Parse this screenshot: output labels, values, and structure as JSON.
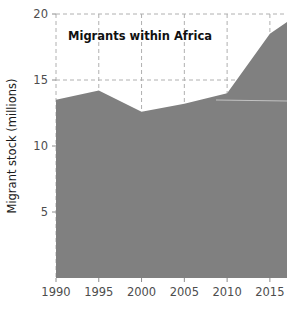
{
  "chart_data": {
    "type": "area",
    "title": "Migrants within Africa",
    "xlabel": "",
    "ylabel": "Migrant stock (millions)",
    "x": [
      1990,
      1995,
      2000,
      2005,
      2010,
      2015,
      2017
    ],
    "values": [
      13.5,
      14.2,
      12.6,
      13.2,
      14.0,
      18.5,
      19.4
    ],
    "series": [
      {
        "name": "Migrants within Africa",
        "values": [
          13.5,
          14.2,
          12.6,
          13.2,
          14.0,
          18.5,
          19.4
        ]
      }
    ],
    "xlim": [
      1990,
      2017
    ],
    "ylim": [
      0,
      20
    ],
    "xticks": [
      1990,
      1995,
      2000,
      2005,
      2010,
      2015
    ],
    "xtick_labels": [
      "1990",
      "1995",
      "2000",
      "2005",
      "2010",
      "2015"
    ],
    "yticks": [
      5,
      10,
      15,
      20
    ],
    "ytick_labels": [
      "5",
      "10",
      "15",
      "20"
    ],
    "grid": true,
    "grid_style": "dashed",
    "legend": "none",
    "colors": {
      "area_fill": "#808080",
      "grid": "#b0b0b0",
      "tick_text": "#4d4d4d",
      "title_text": "#111111",
      "background": "#ffffff"
    }
  },
  "axis": {
    "y_title": "Migrant stock (millions)",
    "ytick_labels": [
      "20",
      "15",
      "10",
      "5"
    ],
    "xtick_labels": [
      "1990",
      "1995",
      "2000",
      "2005",
      "2010",
      "2015"
    ]
  },
  "panel": {
    "title": "Migrants within Africa"
  }
}
